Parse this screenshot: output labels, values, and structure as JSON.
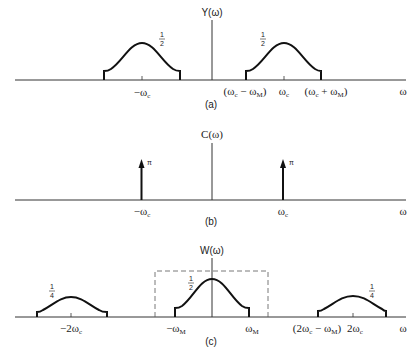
{
  "panels": [
    {
      "id": "a",
      "caption": "(a)",
      "ylabel": "Y(ω)",
      "xlabel": "ω",
      "humps": [
        {
          "center_label": "−ω_c",
          "center_text": "−ωc",
          "height_label": "1/2"
        },
        {
          "center_label": "ω_c",
          "center_text": "ωc",
          "height_label": "1/2",
          "left_edge_label": "(ωc − ωM)",
          "right_edge_label": "(ωc + ωM)"
        }
      ]
    },
    {
      "id": "b",
      "caption": "(b)",
      "ylabel": "C(ω)",
      "xlabel": "ω",
      "impulses": [
        {
          "position_label": "−ωc",
          "weight": "π"
        },
        {
          "position_label": "ωc",
          "weight": "π"
        }
      ]
    },
    {
      "id": "c",
      "caption": "(c)",
      "ylabel": "W(ω)",
      "xlabel": "ω",
      "humps": [
        {
          "center_label": "−2ωc",
          "height_label": "1/4"
        },
        {
          "center_label": "0",
          "height_label": "1/2",
          "left_edge_label": "−ωM",
          "right_edge_label": "ωM"
        },
        {
          "center_label": "2ωc",
          "height_label": "1/4",
          "left_edge_label": "(2ωc − ωM)"
        }
      ],
      "lowpass_filter": "dashed rectangle from −ωM to ωM"
    }
  ],
  "text": {
    "a_ylabel": "Y(ω)",
    "a_neg_wc": "−ω",
    "a_wc": "ω",
    "a_left_edge": "(ω",
    "a_right_edge": "(ω",
    "a_half_left": "1",
    "a_half_right": "1",
    "a_two": "2",
    "a_caption": "(a)",
    "omega": "ω",
    "b_ylabel": "C(ω)",
    "pi": "π",
    "b_caption": "(b)",
    "c_ylabel": "W(ω)",
    "c_caption": "(c)",
    "c_quarter_num": "1",
    "c_quarter_den": "4",
    "c_half_num": "1",
    "c_half_den": "2"
  }
}
